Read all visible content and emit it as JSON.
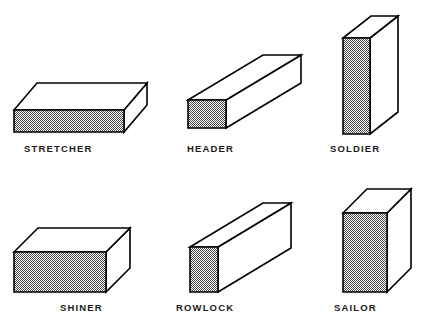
{
  "diagram": {
    "background_color": "#ffffff",
    "outline_color": "#000000",
    "shade_fill_color": "#808080",
    "white_face_color": "#ffffff",
    "label_color": "#1a1a1a"
  },
  "bricks": [
    {
      "id": "stretcher",
      "label": "STRETCHER",
      "label_x": 24,
      "label_y": 152,
      "description": "brick laid flat with long face showing",
      "shaded_face": "front-long",
      "front": {
        "x": 14,
        "y": 110,
        "w": 110,
        "h": 22
      },
      "depth": {
        "dx": 23,
        "dy": -27
      }
    },
    {
      "id": "header",
      "label": "HEADER",
      "label_x": 187,
      "label_y": 152,
      "description": "brick laid flat with short end face showing",
      "shaded_face": "front-end",
      "front": {
        "x": 188,
        "y": 100,
        "w": 38,
        "h": 28
      },
      "depth": {
        "dx": 75,
        "dy": -45
      }
    },
    {
      "id": "soldier",
      "label": "SOLDIER",
      "label_x": 330,
      "label_y": 152,
      "description": "brick standing on end with narrow face showing",
      "shaded_face": "front-narrow",
      "front": {
        "x": 343,
        "y": 38,
        "w": 27,
        "h": 96
      },
      "depth": {
        "dx": 28,
        "dy": -22
      }
    },
    {
      "id": "shiner",
      "label": "SHINER",
      "label_x": 60,
      "label_y": 311,
      "description": "brick laid on narrow side with broad face showing",
      "shaded_face": "front-broad",
      "front": {
        "x": 14,
        "y": 252,
        "w": 92,
        "h": 40
      },
      "depth": {
        "dx": 24,
        "dy": -24
      }
    },
    {
      "id": "rowlock",
      "label": "ROWLOCK",
      "label_x": 176,
      "label_y": 311,
      "description": "brick on edge with short end face showing",
      "shaded_face": "front-end",
      "front": {
        "x": 190,
        "y": 247,
        "w": 28,
        "h": 45
      },
      "depth": {
        "dx": 73,
        "dy": -44
      }
    },
    {
      "id": "sailor",
      "label": "SAILOR",
      "label_x": 334,
      "label_y": 311,
      "description": "brick standing on end with broad face showing",
      "shaded_face": "front-broad",
      "front": {
        "x": 343,
        "y": 213,
        "w": 44,
        "h": 79
      },
      "depth": {
        "dx": 24,
        "dy": -24
      }
    }
  ]
}
